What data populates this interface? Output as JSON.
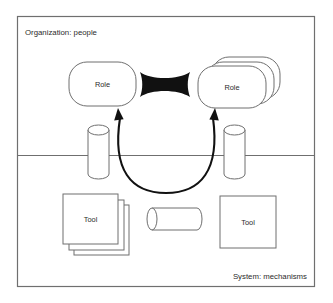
{
  "diagram": {
    "type": "two-layer block diagram",
    "zones": [
      {
        "id": "organization",
        "label": "Organization: people",
        "label_position": "top-left"
      },
      {
        "id": "system",
        "label": "System: mechanisms",
        "label_position": "bottom-right"
      }
    ],
    "nodes": [
      {
        "id": "role-left",
        "label": "Role",
        "shape": "rounded-rectangle",
        "zone": "organization",
        "stacked": false
      },
      {
        "id": "role-right",
        "label": "Role",
        "shape": "rounded-rectangle-stack",
        "zone": "organization",
        "stacked": true,
        "stack_count": 3
      },
      {
        "id": "tool-left",
        "label": "Tool",
        "shape": "rectangle-stack",
        "zone": "system",
        "stacked": true,
        "stack_count": 3
      },
      {
        "id": "tool-right",
        "label": "Tool",
        "shape": "rectangle",
        "zone": "system",
        "stacked": false
      },
      {
        "id": "cylinder-left",
        "label": "",
        "shape": "vertical-cylinder",
        "zone": "boundary"
      },
      {
        "id": "cylinder-right",
        "label": "",
        "shape": "vertical-cylinder",
        "zone": "boundary"
      },
      {
        "id": "cylinder-middle",
        "label": "",
        "shape": "horizontal-cylinder",
        "zone": "system"
      }
    ],
    "connectors": [
      {
        "id": "role-link",
        "style": "solid-black-bowtie",
        "from": "role-left",
        "to": "role-right",
        "color": "#111111"
      },
      {
        "id": "feedback-arc",
        "style": "curved-double-arrow",
        "from": "role-left",
        "to": "role-right",
        "direction": "both",
        "color": "#111111"
      }
    ],
    "colors": {
      "outline": "#6f6f6f",
      "connector": "#111111",
      "text": "#2b2b2b",
      "background": "#ffffff"
    }
  }
}
